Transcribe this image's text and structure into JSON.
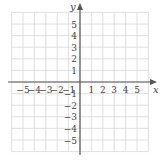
{
  "chart_data": {
    "type": "scatter",
    "title": "",
    "xlabel": "x",
    "ylabel": "y",
    "xlim": [
      -6,
      6
    ],
    "ylim": [
      -6,
      6
    ],
    "grid": true,
    "x_ticks": [
      -5,
      -4,
      -3,
      -2,
      -1,
      1,
      2,
      3,
      4,
      5
    ],
    "y_ticks": [
      5,
      4,
      3,
      2,
      1,
      -1,
      -2,
      -3,
      -4,
      -5
    ],
    "x_tick_labels": [
      "−5",
      "−4",
      "−3",
      "−2",
      "−1",
      "1",
      "2",
      "3",
      "4",
      "5"
    ],
    "y_tick_labels": [
      "5",
      "4",
      "3",
      "2",
      "1",
      "−1",
      "−2",
      "−3",
      "−4",
      "−5"
    ],
    "series": []
  },
  "colors": {
    "grid": "#d8d8d8",
    "axis": "#555555",
    "text": "#444444"
  }
}
